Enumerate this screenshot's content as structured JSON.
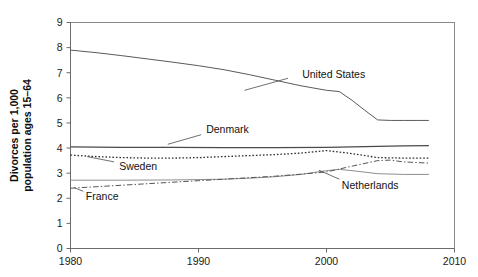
{
  "chart_data": {
    "type": "line",
    "title": "",
    "xlabel": "",
    "ylabel": "Divorces per 1,000 population ages 15–64",
    "ylabel_line1": "Divorces per 1,000",
    "ylabel_line2": "population ages 15–64",
    "xlim": [
      1980,
      2010
    ],
    "ylim": [
      0,
      9
    ],
    "xticks": [
      1980,
      1990,
      2000,
      2010
    ],
    "xtick_labels": [
      "1980",
      "1990",
      "2000",
      "2010"
    ],
    "yticks": [
      0,
      1,
      2,
      3,
      4,
      5,
      6,
      7,
      8,
      9
    ],
    "ytick_labels": [
      "0",
      "1",
      "2",
      "3",
      "4",
      "5",
      "6",
      "7",
      "8",
      "9"
    ],
    "grid": false,
    "legend_position": "inline-annotations",
    "series": [
      {
        "name": "United States",
        "style": "solid",
        "color": "#5a5a5a",
        "width": 1.0,
        "label_x": 1998.1,
        "label_y": 6.95,
        "leader": [
          [
            1997.0,
            6.78
          ],
          [
            1993.6,
            6.3
          ]
        ],
        "x": [
          1980,
          1982,
          1984,
          1986,
          1988,
          1990,
          1992,
          1994,
          1996,
          1998,
          2000,
          2001,
          2002,
          2003,
          2004,
          2005,
          2006,
          2007,
          2008
        ],
        "values": [
          7.9,
          7.8,
          7.68,
          7.55,
          7.42,
          7.28,
          7.12,
          6.92,
          6.7,
          6.48,
          6.3,
          6.25,
          5.9,
          5.5,
          5.12,
          5.1,
          5.1,
          5.1,
          5.1
        ]
      },
      {
        "name": "Denmark",
        "style": "solid",
        "color": "#4a4a4a",
        "width": 1.3,
        "label_x": 1990.6,
        "label_y": 4.75,
        "leader": [
          [
            1990.2,
            4.53
          ],
          [
            1987.6,
            4.15
          ]
        ],
        "x": [
          1980,
          1984,
          1988,
          1992,
          1996,
          2000,
          2002,
          2004,
          2006,
          2008
        ],
        "values": [
          4.05,
          4.03,
          4.03,
          4.02,
          4.02,
          4.03,
          4.05,
          4.07,
          4.09,
          4.1
        ]
      },
      {
        "name": "Sweden",
        "style": "dotted",
        "color": "#2f2f2f",
        "width": 1.3,
        "label_x": 1983.8,
        "label_y": 3.28,
        "leader": [
          [
            1983.4,
            3.45
          ],
          [
            1981.3,
            3.66
          ]
        ],
        "x": [
          1980,
          1982,
          1984,
          1986,
          1988,
          1990,
          1992,
          1994,
          1996,
          1998,
          2000,
          2002,
          2004,
          2006,
          2008
        ],
        "values": [
          3.72,
          3.66,
          3.62,
          3.6,
          3.6,
          3.62,
          3.66,
          3.7,
          3.74,
          3.8,
          3.9,
          3.78,
          3.62,
          3.6,
          3.6
        ]
      },
      {
        "name": "Netherlands",
        "style": "solid",
        "color": "#8e8e8e",
        "width": 1.0,
        "label_x": 2001.2,
        "label_y": 2.52,
        "leader": [
          [
            2001.0,
            2.76
          ],
          [
            1999.4,
            3.12
          ]
        ],
        "x": [
          1980,
          1984,
          1988,
          1992,
          1994,
          1996,
          1998,
          2000,
          2001,
          2002,
          2004,
          2006,
          2008
        ],
        "values": [
          2.72,
          2.72,
          2.73,
          2.76,
          2.8,
          2.86,
          2.95,
          3.1,
          3.15,
          3.1,
          2.98,
          2.95,
          2.95
        ]
      },
      {
        "name": "France",
        "style": "dashdot",
        "color": "#555555",
        "width": 1.0,
        "label_x": 1981.2,
        "label_y": 2.1,
        "leader": [
          [
            1981.0,
            2.28
          ],
          [
            1980.3,
            2.42
          ]
        ],
        "x": [
          1980,
          1982,
          1984,
          1986,
          1988,
          1990,
          1992,
          1994,
          1996,
          1998,
          2000,
          2002,
          2004,
          2005,
          2006,
          2008
        ],
        "values": [
          2.4,
          2.46,
          2.52,
          2.58,
          2.64,
          2.7,
          2.76,
          2.82,
          2.88,
          2.96,
          3.05,
          3.28,
          3.5,
          3.52,
          3.45,
          3.4
        ]
      }
    ]
  },
  "labels": {
    "united_states": "United States",
    "denmark": "Denmark",
    "sweden": "Sweden",
    "netherlands": "Netherlands",
    "france": "France"
  }
}
